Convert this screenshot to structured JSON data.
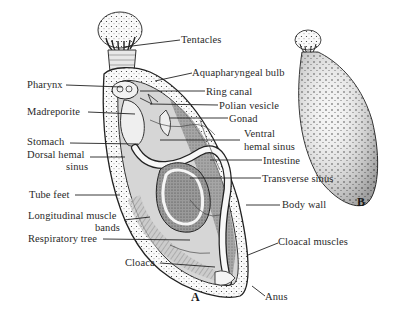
{
  "figure": {
    "panel_a_label": "A",
    "panel_b_label": "B",
    "labels_right": {
      "tentacles": "Tentacles",
      "aquapharyngeal_bulb": "Aquapharyngeal bulb",
      "ring_canal": "Ring canal",
      "polian_vesicle": "Polian vesicle",
      "gonad": "Gonad",
      "ventral_hemal_sinus_1": "Ventral",
      "ventral_hemal_sinus_2": "hemal sinus",
      "intestine": "Intestine",
      "transverse_sinus": "Transverse sinus",
      "body_wall": "Body wall",
      "cloacal_muscles": "Cloacal muscles",
      "anus": "Anus"
    },
    "labels_left": {
      "pharynx": "Pharynx",
      "madreporite": "Madreporite",
      "stomach": "Stomach",
      "dorsal_hemal_sinus_1": "Dorsal hemal",
      "dorsal_hemal_sinus_2": "sinus",
      "tube_feet": "Tube feet",
      "longitudinal_muscle_bands_1": "Longitudinal muscle",
      "longitudinal_muscle_bands_2": "bands",
      "respiratory_tree": "Respiratory tree",
      "cloaca": "Cloaca"
    }
  }
}
